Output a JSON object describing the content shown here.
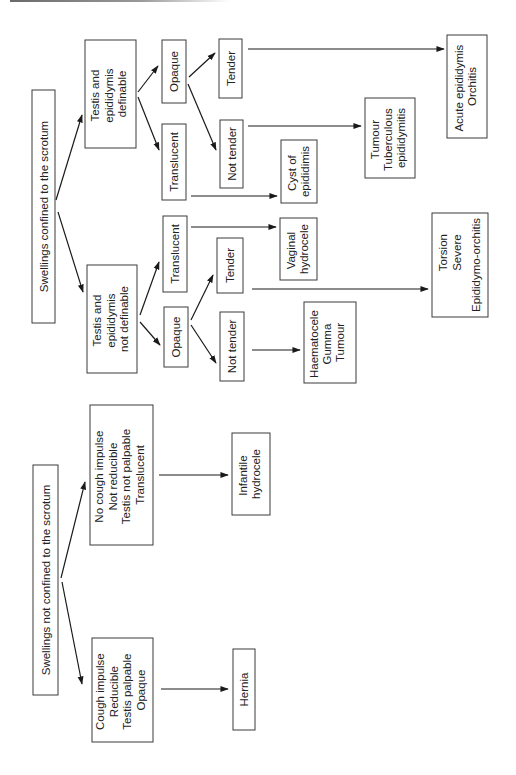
{
  "diagram": {
    "orientation": "rotated-90-ccw",
    "nodes": {
      "root_confined": {
        "lines": [
          "Swellings confined to the scrotum"
        ]
      },
      "root_not_confined": {
        "lines": [
          "Swellings not confined to the scrotum"
        ]
      },
      "te_definable": {
        "lines": [
          "Testis and",
          "epididymis",
          "definable"
        ]
      },
      "te_not_definable": {
        "lines": [
          "Testis and",
          "epididymis",
          "not definable"
        ]
      },
      "def_opaque": {
        "lines": [
          "Opaque"
        ]
      },
      "def_translucent": {
        "lines": [
          "Translucent"
        ]
      },
      "def_opaque_tender": {
        "lines": [
          "Tender"
        ]
      },
      "def_opaque_not_tender": {
        "lines": [
          "Not tender"
        ]
      },
      "cyst": {
        "lines": [
          "Cyst of",
          "epididimis"
        ]
      },
      "ndef_translucent": {
        "lines": [
          "Translucent"
        ]
      },
      "vaginal": {
        "lines": [
          "Vaginal",
          "hydrocele"
        ]
      },
      "ndef_opaque": {
        "lines": [
          "Opaque"
        ]
      },
      "ndef_opaque_tender": {
        "lines": [
          "Tender"
        ]
      },
      "ndef_opaque_not_tender": {
        "lines": [
          "Not tender"
        ]
      },
      "haematocele": {
        "lines": [
          "Haematocele",
          "Gumma",
          "Tumour"
        ]
      },
      "torsion": {
        "lines": [
          "Torsion",
          "Severe",
          "Epididymo-orchitis"
        ]
      },
      "tumour_tb": {
        "lines": [
          "Tumour",
          "Tuberculous",
          "epididymitis"
        ]
      },
      "acute": {
        "lines": [
          "Acute epididymis",
          "Orchitis"
        ]
      },
      "no_cough": {
        "lines": [
          "No cough impulse",
          "Not reducible",
          "Testis not palpable",
          "Translucent"
        ]
      },
      "infantile": {
        "lines": [
          "Infantile",
          "hydrocele"
        ]
      },
      "cough": {
        "lines": [
          "Cough impulse",
          "Reducible",
          "Testis palpable",
          "Opaque"
        ]
      },
      "hernia": {
        "lines": [
          "Hernia"
        ]
      }
    },
    "edges": [
      [
        "root_confined",
        "te_definable"
      ],
      [
        "root_confined",
        "te_not_definable"
      ],
      [
        "te_definable",
        "def_opaque"
      ],
      [
        "te_definable",
        "def_translucent"
      ],
      [
        "def_opaque",
        "def_opaque_tender"
      ],
      [
        "def_opaque",
        "def_opaque_not_tender"
      ],
      [
        "def_opaque_tender",
        "acute"
      ],
      [
        "def_opaque_not_tender",
        "tumour_tb"
      ],
      [
        "def_translucent",
        "cyst"
      ],
      [
        "te_not_definable",
        "ndef_translucent"
      ],
      [
        "te_not_definable",
        "ndef_opaque"
      ],
      [
        "ndef_translucent",
        "vaginal"
      ],
      [
        "ndef_opaque",
        "ndef_opaque_tender"
      ],
      [
        "ndef_opaque",
        "ndef_opaque_not_tender"
      ],
      [
        "ndef_opaque_tender",
        "torsion"
      ],
      [
        "ndef_opaque_not_tender",
        "haematocele"
      ],
      [
        "root_not_confined",
        "no_cough"
      ],
      [
        "root_not_confined",
        "cough"
      ],
      [
        "no_cough",
        "infantile"
      ],
      [
        "cough",
        "hernia"
      ]
    ]
  }
}
